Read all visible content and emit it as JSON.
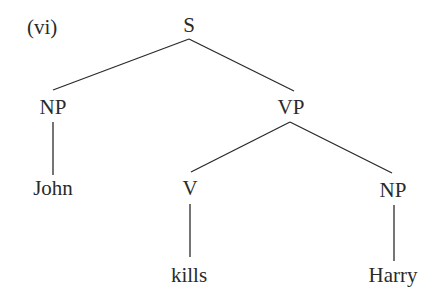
{
  "example_label": "(vi)",
  "tree": {
    "nodes": [
      {
        "id": "S",
        "label": "S",
        "x": 189,
        "y": 16
      },
      {
        "id": "NP1",
        "label": "NP",
        "x": 53,
        "y": 96
      },
      {
        "id": "VP",
        "label": "VP",
        "x": 291,
        "y": 96
      },
      {
        "id": "John",
        "label": "John",
        "x": 53,
        "y": 177
      },
      {
        "id": "V",
        "label": "V",
        "x": 190,
        "y": 177
      },
      {
        "id": "NP2",
        "label": "NP",
        "x": 393,
        "y": 179
      },
      {
        "id": "kills",
        "label": "kills",
        "x": 189,
        "y": 264
      },
      {
        "id": "Harry",
        "label": "Harry",
        "x": 393,
        "y": 264
      }
    ],
    "edges": [
      {
        "from": "S",
        "to": "NP1"
      },
      {
        "from": "S",
        "to": "VP"
      },
      {
        "from": "NP1",
        "to": "John"
      },
      {
        "from": "VP",
        "to": "V"
      },
      {
        "from": "VP",
        "to": "NP2"
      },
      {
        "from": "V",
        "to": "kills"
      },
      {
        "from": "NP2",
        "to": "Harry"
      }
    ]
  },
  "line_color": "#2a2a2a"
}
